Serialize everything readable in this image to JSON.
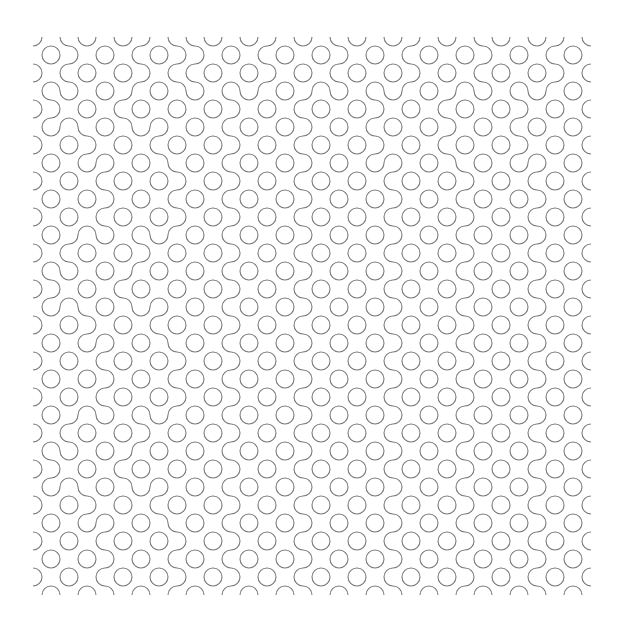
{
  "pattern": {
    "type": "truchet-quarter-circle",
    "rows": 31,
    "cols": 31,
    "tile_size": 18,
    "origin": [
      33,
      37
    ],
    "stroke_color": "#7a7a7a",
    "background_color": "#ffffff",
    "seed": 20240517,
    "tiles": [
      "0110100111010010110100101101001",
      "1001011000101101001011010010110",
      "0110100111010010110100101101001",
      "1101001010110100101101001011010",
      "0010110101001011010010110100101",
      "1011010010110100101101001011010",
      "0100101101001011010010110100101",
      "1010010110110100101001011010010",
      "0101101001001011010110100101101",
      "1010010110110100101001011010010",
      "0101101001001011010110100101101",
      "1001011010110100101001011010010",
      "0110100101001011010110100101101",
      "1101001010110100101001011010010",
      "0010110101001011010110100101101",
      "1011010010110100101001011010010",
      "0100101101001011010110100101101",
      "1010010110110100101001011010010",
      "0101101001001011010110100101101",
      "1010010110110100101001011010010",
      "0101101001001011010110100101101",
      "1001011010110100101001011010010",
      "0110100101001011010110100101101",
      "1101001010110100101001011010010",
      "0010110101001011010110100101101",
      "1011010010110100101001011010010",
      "0100101101001011010110100101101",
      "1010010110110100101001011010010",
      "0101101001001011010110100101101",
      "1010010110110100101001011010010",
      "0101101001001011010110100101101"
    ]
  }
}
